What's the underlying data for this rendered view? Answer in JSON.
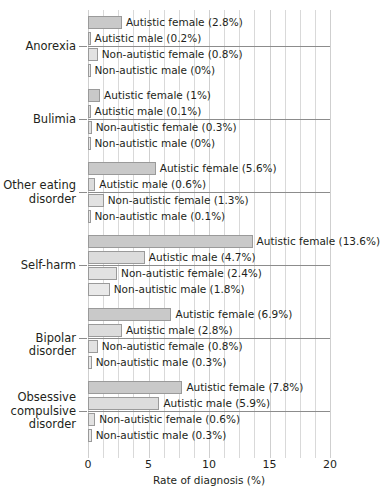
{
  "chart_data": {
    "type": "bar",
    "title": "",
    "xlabel": "Rate of diagnosis (%)",
    "ylabel": "",
    "xlim": [
      0,
      20
    ],
    "xticks": [
      0,
      5,
      10,
      15,
      20
    ],
    "xtick_labels": [
      "0",
      "5",
      "10",
      "15",
      "20"
    ],
    "grid": true,
    "grid_axis": "x",
    "orientation": "horizontal",
    "legend": "inline-labels",
    "categories": [
      "Anorexia",
      "Bulimia",
      "Other eating disorder",
      "Self-harm",
      "Bipolar disorder",
      "Obsessive compulsive disorder"
    ],
    "series": [
      {
        "name": "Autistic female",
        "values": [
          2.8,
          1,
          5.6,
          13.6,
          6.9,
          7.8
        ]
      },
      {
        "name": "Autistic male",
        "values": [
          0.2,
          0.1,
          0.6,
          4.7,
          2.8,
          5.9
        ]
      },
      {
        "name": "Non-autistic female",
        "values": [
          0.8,
          0.3,
          1.3,
          2.4,
          0.8,
          0.6
        ]
      },
      {
        "name": "Non-autistic male",
        "values": [
          0,
          0,
          0.1,
          1.8,
          0.3,
          0.3
        ]
      }
    ],
    "bar_labels": [
      [
        "Autistic female (2.8%)",
        "Autistic male (0.2%)",
        "Non-autistic female (0.8%)",
        "Non-autistic male (0%)"
      ],
      [
        "Autistic female (1%)",
        "Autistic male (0.1%)",
        "Non-autistic female (0.3%)",
        "Non-autistic male (0%)"
      ],
      [
        "Autistic female (5.6%)",
        "Autistic male (0.6%)",
        "Non-autistic female (1.3%)",
        "Non-autistic male (0.1%)"
      ],
      [
        "Autistic female (13.6%)",
        "Autistic male (4.7%)",
        "Non-autistic female (2.4%)",
        "Non-autistic male (1.8%)"
      ],
      [
        "Autistic female (6.9%)",
        "Autistic male (2.8%)",
        "Non-autistic female (0.8%)",
        "Non-autistic male (0.3%)"
      ],
      [
        "Autistic female (7.8%)",
        "Autistic male (5.9%)",
        "Non-autistic female (0.6%)",
        "Non-autistic male (0.3%)"
      ]
    ],
    "category_labels_display": [
      "Anorexia",
      "Bulimia",
      "Other eating\ndisorder",
      "Self-harm",
      "Bipolar disorder",
      "Obsessive\ncompulsive\ndisorder"
    ],
    "colors": {
      "autistic_female": "#c9c9c9",
      "autistic_male": "#dcdcdc",
      "non_autistic_female": "#e2e2e2",
      "non_autistic_male": "#e9e9e9",
      "bar_border": "#9a9a9a",
      "gridline": "#d9d9d9",
      "axis": "#6f6f6f",
      "text": "#231f20",
      "background": "#ffffff"
    }
  },
  "axis": {
    "x_title": "Rate of diagnosis (%)"
  }
}
